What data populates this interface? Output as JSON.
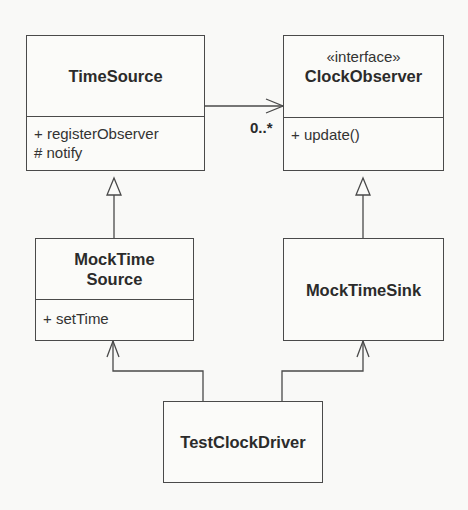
{
  "diagram": {
    "type": "UML class diagram",
    "classes": {
      "time_source": {
        "name": "TimeSource",
        "operations": [
          "+ registerObserver",
          "# notify"
        ]
      },
      "clock_observer": {
        "stereotype": "«interface»",
        "name": "ClockObserver",
        "operations": [
          "+ update()"
        ]
      },
      "mock_time_source": {
        "name_line1": "MockTime",
        "name_line2": "Source",
        "operations": [
          "+ setTime"
        ]
      },
      "mock_time_sink": {
        "name": "MockTimeSink"
      },
      "test_clock_driver": {
        "name": "TestClockDriver"
      }
    },
    "relationships": [
      {
        "kind": "association",
        "from": "TimeSource",
        "to": "ClockObserver",
        "navigable": true,
        "multiplicity": "0..*"
      },
      {
        "kind": "generalization",
        "from": "MockTimeSource",
        "to": "TimeSource"
      },
      {
        "kind": "generalization",
        "from": "MockTimeSink",
        "to": "ClockObserver"
      },
      {
        "kind": "dependency",
        "from": "TestClockDriver",
        "to": "MockTimeSource"
      },
      {
        "kind": "dependency",
        "from": "TestClockDriver",
        "to": "MockTimeSink"
      }
    ],
    "association_multiplicity": "0..*",
    "colors": {
      "line": "#4a4a4a",
      "text": "#2b2b2b",
      "background": "#f9f9f7"
    }
  }
}
